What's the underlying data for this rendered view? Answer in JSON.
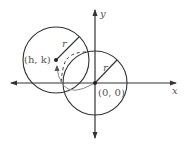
{
  "diagram": {
    "type": "coordinate-plane-circle-translation",
    "axes": {
      "x_label": "x",
      "y_label": "y"
    },
    "circles": [
      {
        "name": "circle-at-origin",
        "center_label": "(0, 0)",
        "radius_label": "r"
      },
      {
        "name": "translated-circle",
        "center_label": "(h, k)",
        "radius_label": "r"
      }
    ],
    "colors": {
      "stroke": "#333333",
      "arrow_path": "#888888",
      "text": "#555555"
    }
  }
}
